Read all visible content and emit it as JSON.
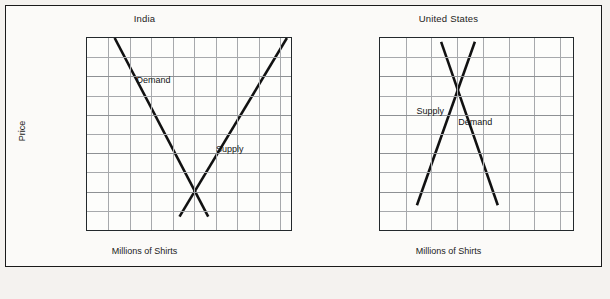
{
  "figure": {
    "background_color": "#fbfaf8",
    "frame_color": "#1a1a1a",
    "grid_color": "#a7a9ac",
    "curve_color": "#111111"
  },
  "chart_data": [
    {
      "type": "line",
      "title": "India",
      "xlabel": "Millions of Shirts",
      "ylabel": "Price",
      "xlim": [
        0,
        1900
      ],
      "ylim": [
        0,
        50
      ],
      "xticks": [
        400,
        800,
        1200,
        1600
      ],
      "xtick_labels": [
        "400",
        "800",
        "1,200",
        "1,600"
      ],
      "yticks": [
        10,
        20,
        30,
        40,
        50
      ],
      "ytick_labels": [
        "$10",
        "$20",
        "$30",
        "$40",
        "$50"
      ],
      "grid": true,
      "grid_x_step": 200,
      "grid_y_step": 5,
      "legend": "inline-labels",
      "series": [
        {
          "name": "Demand",
          "label": "Demand",
          "label_x": 620,
          "label_y": 39,
          "points": [
            [
              260,
              50
            ],
            [
              1140,
              3
            ]
          ]
        },
        {
          "name": "Supply",
          "label": "Supply",
          "label_x": 1330,
          "label_y": 21,
          "points": [
            [
              870,
              3
            ],
            [
              1880,
              50
            ]
          ]
        }
      ],
      "equilibrium": {
        "x": 1000,
        "y": 10
      }
    },
    {
      "type": "line",
      "title": "United States",
      "xlabel": "Millions of Shirts",
      "ylabel": "Price",
      "xlim": [
        0,
        1500
      ],
      "ylim": [
        0,
        50
      ],
      "xticks": [
        400,
        800,
        1200
      ],
      "xtick_labels": [
        "400",
        "800",
        "1,200"
      ],
      "yticks": [
        10,
        20,
        30,
        40,
        50
      ],
      "ytick_labels": [
        "$10",
        "$20",
        "$30",
        "$40",
        "$50"
      ],
      "grid": true,
      "grid_x_step": 200,
      "grid_y_step": 5,
      "legend": "inline-labels",
      "series": [
        {
          "name": "Supply",
          "label": "Supply",
          "label_x": 390,
          "label_y": 31,
          "points": [
            [
              290,
              6
            ],
            [
              745,
              49
            ]
          ]
        },
        {
          "name": "Demand",
          "label": "Demand",
          "label_x": 740,
          "label_y": 28,
          "points": [
            [
              480,
              49
            ],
            [
              925,
              6
            ]
          ]
        }
      ],
      "equilibrium": {
        "x": 600,
        "y": 40
      }
    }
  ]
}
